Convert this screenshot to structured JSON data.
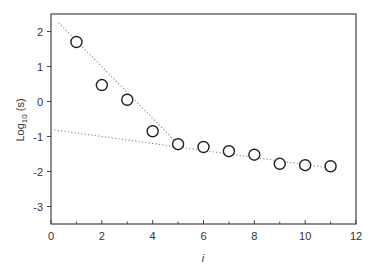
{
  "chart_data": {
    "type": "scatter",
    "title": "",
    "xlabel": "i",
    "ylabel": "Log10 (s)",
    "ylabel_parts": {
      "main": "Log",
      "sub": "10",
      "rest": " (s)"
    },
    "xlim": [
      0,
      12
    ],
    "ylim": [
      -3.5,
      2.5
    ],
    "xticks": [
      0,
      2,
      4,
      6,
      8,
      10,
      12
    ],
    "xticks_minor": [
      1,
      3,
      5,
      7,
      9,
      11
    ],
    "yticks": [
      2,
      1,
      0,
      -1,
      -2,
      -3
    ],
    "grid": false,
    "legend": null,
    "series": [
      {
        "name": "data",
        "marker": "open-circle",
        "x": [
          1,
          2,
          3,
          4,
          5,
          6,
          7,
          8,
          9,
          10,
          11
        ],
        "y": [
          1.7,
          0.47,
          0.05,
          -0.85,
          -1.22,
          -1.3,
          -1.42,
          -1.52,
          -1.78,
          -1.82,
          -1.85
        ]
      },
      {
        "name": "fit-steep",
        "style": "dotted-line",
        "x": [
          0.3,
          5.0
        ],
        "y": [
          2.25,
          -1.22
        ]
      },
      {
        "name": "fit-shallow",
        "style": "dotted-line",
        "x": [
          0.0,
          11.0
        ],
        "y": [
          -0.8,
          -1.9
        ]
      }
    ]
  },
  "colors": {
    "axis": "#444444",
    "marker": "#222222",
    "fit_line": "#888888",
    "text": "#333333"
  }
}
